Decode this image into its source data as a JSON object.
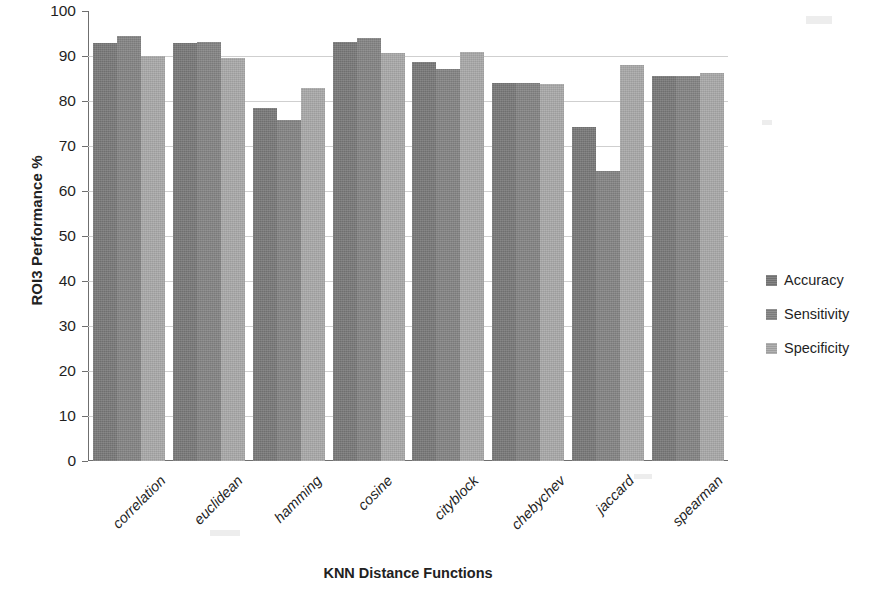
{
  "chart_data": {
    "type": "bar",
    "title": "",
    "xlabel": "KNN Distance Functions",
    "ylabel": "ROI3 Performance %",
    "ylim": [
      0,
      100
    ],
    "ytick_step": 10,
    "yticks": [
      100,
      90,
      80,
      70,
      60,
      50,
      40,
      30,
      20,
      10,
      0
    ],
    "grid": true,
    "legend_position": "right",
    "categories": [
      "correlation",
      "euclidean",
      "hamming",
      "cosine",
      "cityblock",
      "chebychev",
      "jaccard",
      "spearman"
    ],
    "series": [
      {
        "name": "Accuracy",
        "color": "#787878",
        "values": [
          93.0,
          93.0,
          78.5,
          93.2,
          88.6,
          84.0,
          74.2,
          85.6
        ]
      },
      {
        "name": "Sensitivity",
        "color": "#848484",
        "values": [
          94.4,
          93.2,
          75.8,
          94.0,
          87.2,
          84.0,
          64.4,
          85.6
        ]
      },
      {
        "name": "Specificity",
        "color": "#a9a9a9",
        "values": [
          90.1,
          89.6,
          83.0,
          90.7,
          90.8,
          83.8,
          88.0,
          86.2
        ]
      }
    ]
  }
}
